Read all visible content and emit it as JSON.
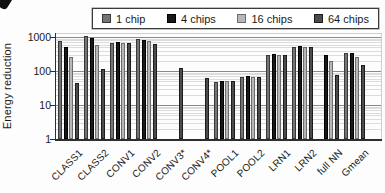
{
  "legend": {
    "position": "top",
    "items_note": "legend entries mirror chart_data.series names and colors"
  },
  "chart_data": {
    "type": "bar",
    "title": "",
    "xlabel": "",
    "ylabel": "Energy reduction",
    "y_scale": "log",
    "ylim": [
      1,
      1300
    ],
    "yticks": [
      1000,
      100,
      10,
      1
    ],
    "ytick_labels": [
      "1000",
      "100",
      "10",
      "1"
    ],
    "grid": "horizontal major + minor log gridlines",
    "legend_position": "top",
    "categories": [
      "CLASS1",
      "CLASS2",
      "CONV1",
      "CONV2",
      "CONV3*",
      "CONV4*",
      "POOL1",
      "POOL2",
      "LRN1",
      "LRN2",
      "full NN",
      "Gmean"
    ],
    "series": [
      {
        "name": "1 chip",
        "color": "#757575",
        "border_color": "#383838",
        "values": [
          790,
          1100,
          690,
          900,
          null,
          null,
          49,
          66,
          300,
          520,
          null,
          340
        ]
      },
      {
        "name": "4 chips",
        "color": "#191919",
        "border_color": "#000000",
        "values": [
          500,
          950,
          710,
          800,
          null,
          null,
          51,
          70,
          310,
          540,
          290,
          350
        ]
      },
      {
        "name": "16 chips",
        "color": "#b7b7b7",
        "border_color": "#6d6d6d",
        "values": [
          260,
          600,
          670,
          750,
          null,
          null,
          50,
          67,
          300,
          520,
          200,
          260
        ]
      },
      {
        "name": "64 chips",
        "color": "#4c4c4c",
        "border_color": "#1c1c1c",
        "values": [
          45,
          115,
          690,
          620,
          120,
          62,
          50,
          68,
          305,
          525,
          78,
          150
        ]
      }
    ]
  }
}
